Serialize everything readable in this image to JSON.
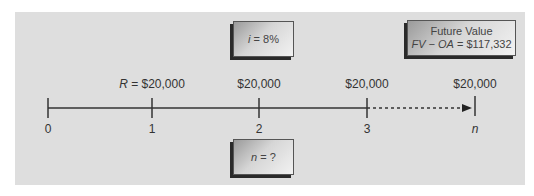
{
  "diagram": {
    "type": "time-value-of-money-timeline",
    "rate_box": {
      "variable": "i",
      "equals": " = ",
      "value": "8%"
    },
    "future_value_box": {
      "title": "Future Value",
      "expression_lhs": "FV − OA",
      "equals": " = ",
      "value": "$117,332"
    },
    "unknown_box": {
      "variable": "n",
      "equals": " = ",
      "value": "?"
    },
    "payment_prefix": "R = ",
    "payments": [
      "$20,000",
      "$20,000",
      "$20,000",
      "$20,000"
    ],
    "periods": [
      "0",
      "1",
      "2",
      "3",
      "n"
    ],
    "colors": {
      "panel": "#dedede",
      "line": "#333333",
      "shadow": "#2a2a2a"
    }
  }
}
